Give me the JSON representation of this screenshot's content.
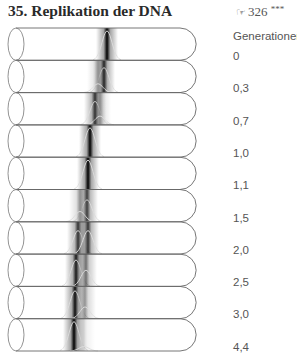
{
  "header": {
    "title": "35. Replikation der DNA",
    "reference": "326",
    "reference_icon": "pointing-hand-icon",
    "difficulty": "***"
  },
  "legend": {
    "heading": "Generationen",
    "generations": [
      "0",
      "0,3",
      "0,7",
      "1,0",
      "1,1",
      "1,5",
      "2,0",
      "2,5",
      "3,0",
      "4,4"
    ]
  },
  "tubes": [
    {
      "gen": "0",
      "bands": [
        {
          "x": 107,
          "w": 1.0
        }
      ]
    },
    {
      "gen": "0,3",
      "bands": [
        {
          "x": 104,
          "w": 0.85
        },
        {
          "x": 98,
          "w": 0.3
        }
      ]
    },
    {
      "gen": "0,7",
      "bands": [
        {
          "x": 95,
          "w": 0.8
        },
        {
          "x": 100,
          "w": 0.3
        }
      ]
    },
    {
      "gen": "1,0",
      "bands": [
        {
          "x": 90,
          "w": 1.0
        }
      ]
    },
    {
      "gen": "1,1",
      "bands": [
        {
          "x": 88,
          "w": 1.0
        }
      ]
    },
    {
      "gen": "1,5",
      "bands": [
        {
          "x": 87,
          "w": 0.75
        },
        {
          "x": 80,
          "w": 0.35
        }
      ]
    },
    {
      "gen": "2,0",
      "bands": [
        {
          "x": 78,
          "w": 0.8
        },
        {
          "x": 88,
          "w": 0.8
        }
      ]
    },
    {
      "gen": "2,5",
      "bands": [
        {
          "x": 76,
          "w": 0.9
        },
        {
          "x": 86,
          "w": 0.55
        }
      ]
    },
    {
      "gen": "3,0",
      "bands": [
        {
          "x": 75,
          "w": 0.95
        },
        {
          "x": 85,
          "w": 0.4
        }
      ]
    },
    {
      "gen": "4,4",
      "bands": [
        {
          "x": 74,
          "w": 1.0
        },
        {
          "x": 84,
          "w": 0.15
        }
      ]
    }
  ]
}
